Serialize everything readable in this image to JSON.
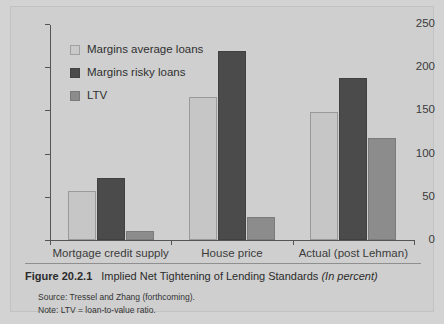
{
  "figure": {
    "number": "Figure 20.2.1",
    "title": "Implied Net Tightening of Lending Standards",
    "units": "(In percent)",
    "source_note": "Source: Tressel and Zhang (forthcoming).",
    "definition_note": "Note: LTV = loan-to-value ratio."
  },
  "colors": {
    "page_background": "#d3d3d3",
    "panel_background": "#cfcfcf",
    "series_light": "#c6c6c6",
    "series_dark": "#4b4b4b",
    "series_mid": "#8c8c8c",
    "axis": "#555555",
    "text": "#2f2f2f"
  },
  "legend": {
    "position": "top-left-inside",
    "entries": [
      {
        "label": "Margins average loans",
        "swatch": "light"
      },
      {
        "label": "Margins risky loans",
        "swatch": "dark"
      },
      {
        "label": "LTV",
        "swatch": "mid"
      }
    ]
  },
  "axes": {
    "y_ticks": [
      "0",
      "50",
      "100",
      "150",
      "200",
      "250"
    ],
    "y_min": 0,
    "y_max": 250,
    "x_categories": [
      "Mortgage credit supply",
      "House price",
      "Actual (post Lehman)"
    ]
  },
  "chart_data": {
    "type": "bar",
    "title": "Implied Net Tightening of Lending Standards",
    "subtitle": "(In percent)",
    "xlabel": "",
    "ylabel": "",
    "ylim": [
      0,
      250
    ],
    "yticks": [
      0,
      50,
      100,
      150,
      200,
      250
    ],
    "grid": false,
    "legend_position": "upper left",
    "categories": [
      "Mortgage credit supply",
      "House price",
      "Actual (post Lehman)"
    ],
    "series": [
      {
        "name": "Margins average loans",
        "values": [
          57,
          165,
          148
        ],
        "color": "#c6c6c6"
      },
      {
        "name": "Margins risky loans",
        "values": [
          72,
          219,
          187
        ],
        "color": "#4b4b4b"
      },
      {
        "name": "LTV",
        "values": [
          11,
          27,
          118
        ],
        "color": "#8c8c8c"
      }
    ],
    "annotations": [
      "Source: Tressel and Zhang (forthcoming).",
      "Note: LTV = loan-to-value ratio."
    ]
  }
}
